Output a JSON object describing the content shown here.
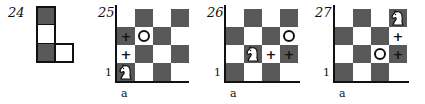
{
  "figures": [
    {
      "number": "24",
      "type": "L-piece",
      "cells": [
        {
          "col": 0,
          "row": 0,
          "shade": "dark"
        },
        {
          "col": 0,
          "row": 1,
          "shade": "light"
        },
        {
          "col": 0,
          "row": 2,
          "shade": "dark"
        },
        {
          "col": 1,
          "row": 2,
          "shade": "light"
        }
      ]
    },
    {
      "number": "25",
      "file_label": "a",
      "rank_label": "1",
      "size": 4,
      "dark_squares": "a1 shading pattern",
      "markers": [
        {
          "square": "a1",
          "type": "knight"
        },
        {
          "square": "a2",
          "type": "plus"
        },
        {
          "square": "a3",
          "type": "plus"
        },
        {
          "square": "b3",
          "type": "circle"
        }
      ]
    },
    {
      "number": "26",
      "file_label": "a",
      "rank_label": "1",
      "size": 4,
      "markers": [
        {
          "square": "b2",
          "type": "knight"
        },
        {
          "square": "c2",
          "type": "plus"
        },
        {
          "square": "d2",
          "type": "plus"
        },
        {
          "square": "d3",
          "type": "circle"
        }
      ]
    },
    {
      "number": "27",
      "file_label": "a",
      "rank_label": "1",
      "size": 4,
      "markers": [
        {
          "square": "d4",
          "type": "knight"
        },
        {
          "square": "d3",
          "type": "plus"
        },
        {
          "square": "d2",
          "type": "plus"
        },
        {
          "square": "c2",
          "type": "circle"
        }
      ]
    }
  ],
  "glyphs": {
    "plus": "+"
  }
}
